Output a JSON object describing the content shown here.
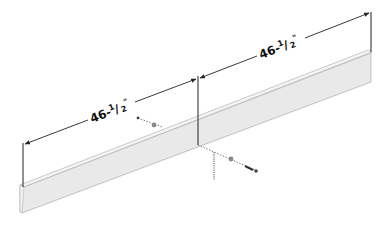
{
  "diagram": {
    "dimensions": [
      {
        "id": "left",
        "whole": "46-",
        "num": "1",
        "den": "2",
        "unit": "\"",
        "label": "46-1/2\""
      },
      {
        "id": "right",
        "whole": "46-",
        "num": "1",
        "den": "2",
        "unit": "\"",
        "label": "46-1/2\""
      }
    ],
    "colors": {
      "board_front": "#e9e9e9",
      "board_top": "#f4f4f4",
      "board_edge": "#b5b5b5",
      "line": "#222222",
      "hardware": "#7a7a7a"
    },
    "parts": [
      "board",
      "screw-left",
      "screw-right",
      "dowel-pin"
    ]
  }
}
